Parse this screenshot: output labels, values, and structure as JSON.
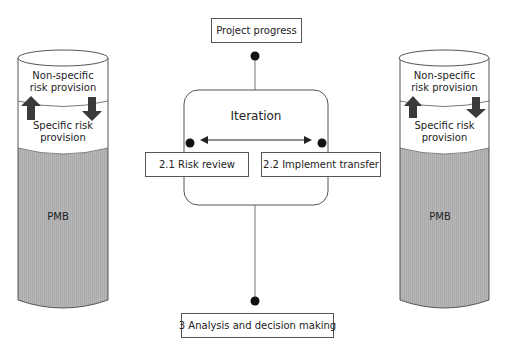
{
  "diagram": {
    "top_box": {
      "label": "Project progress"
    },
    "iteration": {
      "title": "Iteration"
    },
    "left_step": {
      "label": "2.1 Risk review"
    },
    "right_step": {
      "label": "2.2 Implement transfer"
    },
    "bottom_box": {
      "label": "3 Analysis and decision making"
    },
    "left_cylinder": {
      "top_label": "Non-specific risk provision",
      "top_label_line1": "Non-specific",
      "top_label_line2": "risk provision",
      "middle_label_line1": "Specific risk",
      "middle_label_line2": "provision",
      "bottom_label": "PMB",
      "arrows": [
        "down-left-up",
        "right-down"
      ]
    },
    "right_cylinder": {
      "top_label_line1": "Non-specific",
      "top_label_line2": "risk provision",
      "middle_label_line1": "Specific risk",
      "middle_label_line2": "provision",
      "bottom_label": "PMB"
    },
    "colors": {
      "line": "#555555",
      "fill_gray": "#b4b4b4",
      "arrow": "#3a3a3a",
      "dot": "#111111"
    }
  }
}
